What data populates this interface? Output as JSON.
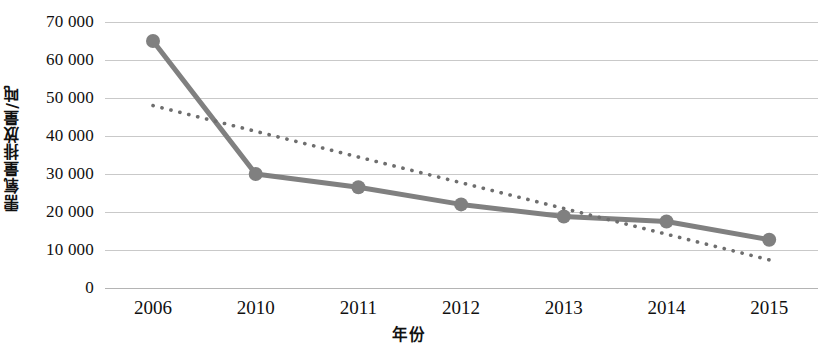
{
  "chart_data": {
    "type": "line",
    "title": "",
    "xlabel": "年份",
    "ylabel": "需氧量排放量/吨",
    "categories": [
      "2006",
      "2010",
      "2011",
      "2012",
      "2013",
      "2014",
      "2015"
    ],
    "series": [
      {
        "name": "需氧量排放量",
        "style": "solid-line-with-round-markers",
        "color": "#808080",
        "values": [
          65000,
          30000,
          26500,
          22000,
          18800,
          17500,
          12700
        ]
      },
      {
        "name": "趋势线",
        "style": "dotted-trendline",
        "color": "#6e6e6e",
        "values": [
          48000,
          41000,
          36500,
          31500,
          26500,
          21500,
          7000
        ],
        "endpoints": {
          "x_start": "2006",
          "y_start": 48000,
          "x_end": "2015",
          "y_end": 7000
        }
      }
    ],
    "ylim": [
      0,
      70000
    ],
    "ytick_labels": [
      "0",
      "10 000",
      "20 000",
      "30 000",
      "40 000",
      "50 000",
      "60 000",
      "70 000"
    ],
    "ytick_values": [
      0,
      10000,
      20000,
      30000,
      40000,
      50000,
      60000,
      70000
    ],
    "grid": true,
    "grid_axis": "y",
    "legend": "none"
  },
  "colors": {
    "series_line": "#808080",
    "trendline": "#6e6e6e",
    "gridline": "#c9c9c9",
    "text": "#101010",
    "background": "#ffffff"
  }
}
